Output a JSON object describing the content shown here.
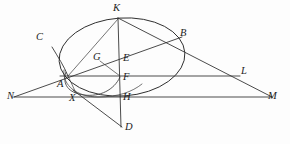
{
  "figure": {
    "kind": "geometry-diagram",
    "width": 290,
    "height": 144,
    "background_color": "#fdfdfd",
    "ink_color": "#2b2b2b",
    "caption_fragment": "",
    "points": [
      {
        "id": "K",
        "label": "K",
        "x": 118,
        "y": 18,
        "label_x": 113,
        "label_y": 3
      },
      {
        "id": "C",
        "label": "C",
        "x": 52,
        "y": 47,
        "label_x": 36,
        "label_y": 32
      },
      {
        "id": "B",
        "label": "B",
        "x": 178,
        "y": 40,
        "label_x": 180,
        "label_y": 28
      },
      {
        "id": "G",
        "label": "G",
        "x": 100,
        "y": 61,
        "label_x": 93,
        "label_y": 52
      },
      {
        "id": "E",
        "label": "E",
        "x": 120,
        "y": 61,
        "label_x": 123,
        "label_y": 53
      },
      {
        "id": "F",
        "label": "F",
        "x": 120,
        "y": 76,
        "label_x": 123,
        "label_y": 72
      },
      {
        "id": "L",
        "label": "L",
        "x": 238,
        "y": 76,
        "label_x": 241,
        "label_y": 66
      },
      {
        "id": "A",
        "label": "A",
        "x": 68,
        "y": 76,
        "label_x": 57,
        "label_y": 79
      },
      {
        "id": "N",
        "label": "N",
        "x": 14,
        "y": 97,
        "label_x": 7,
        "label_y": 91
      },
      {
        "id": "X",
        "label": "X",
        "x": 73,
        "y": 90,
        "label_x": 69,
        "label_y": 93
      },
      {
        "id": "H",
        "label": "H",
        "x": 120,
        "y": 97,
        "label_x": 123,
        "label_y": 92
      },
      {
        "id": "M",
        "label": "M",
        "x": 272,
        "y": 97,
        "label_x": 268,
        "label_y": 91
      },
      {
        "id": "D",
        "label": "D",
        "x": 122,
        "y": 127,
        "label_x": 125,
        "label_y": 122
      }
    ],
    "segments": [
      {
        "name": "baseline-NM",
        "from": "N",
        "to": "M"
      },
      {
        "name": "chord-AL",
        "from": "A",
        "to": "L"
      },
      {
        "name": "ray-N-through-A-B",
        "from": "N",
        "to": "B"
      },
      {
        "name": "line-K-B-M",
        "from": "K",
        "to": "M"
      },
      {
        "name": "vertical-K-D",
        "from": "K",
        "to": "D"
      },
      {
        "name": "segment-X-D",
        "from": "X",
        "to": "D"
      },
      {
        "name": "segment-G-F",
        "from": "G",
        "to": "F"
      },
      {
        "name": "segment-K-A",
        "from": "K",
        "to": "A"
      }
    ],
    "curves": [
      {
        "name": "main-ellipse",
        "type": "ellipse",
        "cx": 122,
        "cy": 57,
        "rx": 63,
        "ry": 39,
        "rotation_deg": -4
      },
      {
        "name": "lower-arc-AXF",
        "type": "arc",
        "through": [
          "A",
          "X",
          "F"
        ]
      },
      {
        "name": "curve-C-to-A",
        "type": "arc",
        "through": [
          "C",
          "A"
        ]
      }
    ]
  }
}
